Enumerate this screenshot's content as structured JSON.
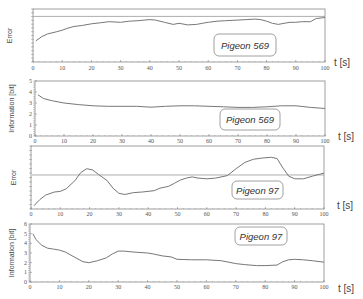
{
  "chart_data": [
    {
      "type": "line",
      "title": "",
      "ylabel": "Error",
      "xlabel": "t [s]",
      "x_ticks": [
        0,
        10,
        20,
        30,
        40,
        50,
        60,
        70,
        80,
        90,
        100
      ],
      "xlim": [
        0,
        100
      ],
      "ylim": [
        0,
        1
      ],
      "y_tick_labels": false,
      "annotation": "Pigeon 569",
      "threshold": 0.86,
      "series": [
        {
          "name": "error",
          "x": [
            1,
            3,
            5,
            8,
            10,
            12,
            14,
            17,
            20,
            23,
            26,
            30,
            33,
            36,
            40,
            42,
            45,
            48,
            50,
            53,
            56,
            58,
            60,
            63,
            66,
            70,
            73,
            76,
            78,
            80,
            82,
            84,
            86,
            88,
            90,
            92,
            95,
            97,
            100
          ],
          "y": [
            0.4,
            0.48,
            0.53,
            0.57,
            0.6,
            0.64,
            0.67,
            0.69,
            0.72,
            0.74,
            0.76,
            0.75,
            0.77,
            0.78,
            0.8,
            0.79,
            0.75,
            0.71,
            0.73,
            0.7,
            0.71,
            0.73,
            0.75,
            0.77,
            0.78,
            0.79,
            0.8,
            0.81,
            0.8,
            0.77,
            0.73,
            0.71,
            0.73,
            0.75,
            0.75,
            0.76,
            0.76,
            0.82,
            0.84
          ]
        }
      ]
    },
    {
      "type": "line",
      "title": "",
      "ylabel": "Information [bit]",
      "xlabel": "t [s]",
      "x_ticks": [
        0,
        10,
        20,
        30,
        40,
        50,
        60,
        70,
        80,
        90,
        100
      ],
      "y_ticks": [
        0,
        1,
        2,
        3,
        4,
        5
      ],
      "xlim": [
        0,
        100
      ],
      "ylim": [
        0,
        5
      ],
      "annotation": "Pigeon 569",
      "series": [
        {
          "name": "information",
          "x": [
            1,
            3,
            6,
            10,
            15,
            20,
            25,
            30,
            35,
            40,
            45,
            50,
            55,
            60,
            65,
            70,
            75,
            80,
            85,
            90,
            95,
            100
          ],
          "y": [
            3.75,
            3.4,
            3.2,
            3.0,
            2.85,
            2.75,
            2.7,
            2.7,
            2.7,
            2.62,
            2.7,
            2.75,
            2.75,
            2.7,
            2.65,
            2.6,
            2.6,
            2.65,
            2.75,
            2.75,
            2.6,
            2.5
          ]
        }
      ]
    },
    {
      "type": "line",
      "title": "",
      "ylabel": "Error",
      "xlabel": "t [s]",
      "x_ticks": [
        0,
        10,
        20,
        30,
        40,
        50,
        60,
        70,
        80,
        90,
        100
      ],
      "xlim": [
        0,
        100
      ],
      "ylim": [
        0,
        1
      ],
      "y_tick_labels": false,
      "annotation": "Pigeon 97",
      "threshold": 0.54,
      "series": [
        {
          "name": "error",
          "x": [
            1,
            3,
            5,
            8,
            10,
            12,
            15,
            17,
            19,
            21,
            23,
            26,
            28,
            30,
            32,
            35,
            38,
            42,
            44,
            47,
            49,
            51,
            53,
            55,
            57,
            60,
            63,
            67,
            70,
            73,
            76,
            79,
            82,
            84,
            86,
            88,
            90,
            93,
            96,
            100
          ],
          "y": [
            0.05,
            0.15,
            0.22,
            0.27,
            0.28,
            0.32,
            0.45,
            0.58,
            0.64,
            0.62,
            0.55,
            0.45,
            0.33,
            0.25,
            0.23,
            0.26,
            0.27,
            0.29,
            0.33,
            0.36,
            0.41,
            0.46,
            0.49,
            0.51,
            0.49,
            0.48,
            0.49,
            0.53,
            0.64,
            0.74,
            0.79,
            0.81,
            0.82,
            0.8,
            0.65,
            0.52,
            0.48,
            0.48,
            0.52,
            0.57
          ]
        }
      ]
    },
    {
      "type": "line",
      "title": "",
      "ylabel": "Information [bit]",
      "xlabel": "t [s]",
      "x_ticks": [
        0,
        10,
        20,
        30,
        40,
        50,
        60,
        70,
        80,
        90,
        100
      ],
      "y_ticks": [
        0,
        1,
        2,
        3,
        4,
        5,
        6
      ],
      "xlim": [
        0,
        100
      ],
      "ylim": [
        0,
        6
      ],
      "annotation": "Pigeon 97",
      "series": [
        {
          "name": "information",
          "x": [
            1,
            2,
            4,
            6,
            8,
            10,
            12,
            15,
            18,
            20,
            23,
            26,
            28,
            30,
            32,
            35,
            40,
            42,
            45,
            48,
            50,
            55,
            60,
            65,
            70,
            73,
            77,
            80,
            84,
            86,
            88,
            90,
            93,
            96,
            100
          ],
          "y": [
            5.0,
            4.4,
            3.8,
            3.5,
            3.4,
            3.3,
            3.1,
            2.6,
            2.1,
            2.0,
            2.2,
            2.5,
            2.9,
            3.2,
            3.2,
            3.1,
            3.0,
            2.9,
            2.7,
            2.6,
            2.35,
            2.3,
            2.3,
            2.2,
            1.9,
            1.8,
            1.7,
            1.7,
            1.75,
            2.1,
            2.3,
            2.35,
            2.3,
            2.2,
            2.05
          ]
        }
      ]
    }
  ],
  "panels": [
    {
      "annotation": "Pigeon 569",
      "ylabel": "Error",
      "xunit": "t [s]"
    },
    {
      "annotation": "Pigeon 569",
      "ylabel": "Information  [bit]",
      "xunit": "t [s]"
    },
    {
      "annotation": "Pigeon 97",
      "ylabel": "Error",
      "xunit": "t [s]"
    },
    {
      "annotation": "Pigeon 97",
      "ylabel": "Information [bit]",
      "xunit": "t [s]"
    }
  ],
  "colors": {
    "curve": "#777777",
    "axis": "#888888",
    "threshold": "#999999",
    "box_border": "#888888",
    "text": "#444444"
  }
}
